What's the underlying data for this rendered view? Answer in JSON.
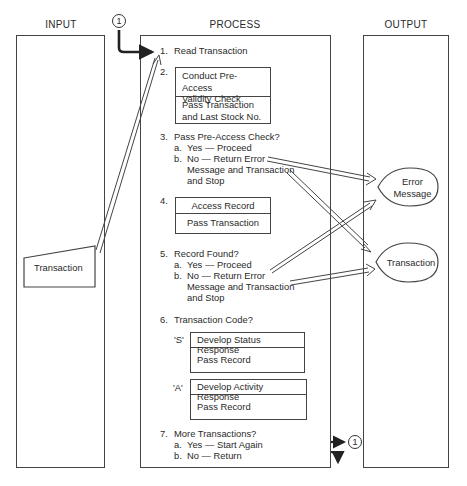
{
  "columns": {
    "input": {
      "title": "INPUT"
    },
    "process": {
      "title": "PROCESS"
    },
    "output": {
      "title": "OUTPUT"
    }
  },
  "connectors": {
    "top": "1",
    "bottom": "1"
  },
  "input": {
    "transaction": "Transaction"
  },
  "process": {
    "step1": {
      "num": "1.",
      "label": "Read Transaction"
    },
    "step2": {
      "num": "2.",
      "box_top": [
        "Conduct Pre-Access",
        "Validity Check"
      ],
      "box_bottom": [
        "Pass Transaction",
        "and Last Stock No."
      ]
    },
    "step3": {
      "num": "3.",
      "label": "Pass Pre-Access Check?",
      "a_num": "a.",
      "a": "Yes — Proceed",
      "b_num": "b.",
      "b1": "No — Return Error",
      "b2": "Message and Transaction",
      "b3": "and Stop"
    },
    "step4": {
      "num": "4.",
      "box_top": "Access Record",
      "box_bottom": "Pass Transaction"
    },
    "step5": {
      "num": "5.",
      "label": "Record Found?",
      "a_num": "a.",
      "a": "Yes — Proceed",
      "b_num": "b.",
      "b1": "No — Return Error",
      "b2": "Message and Transaction",
      "b3": "and Stop"
    },
    "step6": {
      "num": "6.",
      "label": "Transaction Code?",
      "s_code": "'S'",
      "s_top": "Develop Status Response",
      "s_bottom": "Pass Record",
      "a_code": "'A'",
      "a_top": "Develop Activity Response",
      "a_bottom": "Pass Record"
    },
    "step7": {
      "num": "7.",
      "label": "More Transactions?",
      "a_num": "a.",
      "a": "Yes — Start Again",
      "b_num": "b.",
      "b": "No — Return"
    }
  },
  "output": {
    "error_message": [
      "Error",
      "Message"
    ],
    "transaction": "Transaction"
  }
}
